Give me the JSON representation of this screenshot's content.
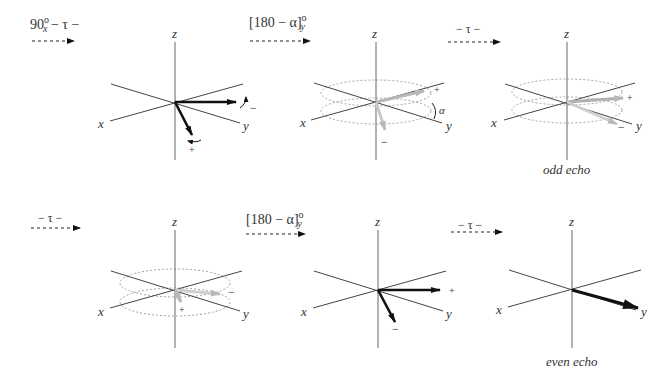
{
  "figure": {
    "pulse_steps": [
      {
        "id": "s1",
        "pre": "90",
        "sup": "o",
        "sub": "x",
        "post": " − τ −"
      },
      {
        "id": "s2",
        "pre": "[180 − α]",
        "sup": "o",
        "sub": "y",
        "post": ""
      },
      {
        "id": "s3",
        "pre": "− τ −",
        "sup": "",
        "sub": "",
        "post": ""
      },
      {
        "id": "s4",
        "pre": "− τ −",
        "sup": "",
        "sub": "",
        "post": ""
      },
      {
        "id": "s5",
        "pre": "[180 − α]",
        "sup": "o",
        "sub": "y",
        "post": ""
      },
      {
        "id": "s6",
        "pre": "− τ −",
        "sup": "",
        "sub": "",
        "post": ""
      }
    ],
    "axis_labels": {
      "x": "x",
      "y": "y",
      "z": "z"
    },
    "sign_plus": "+",
    "sign_minus": "−",
    "angle_label": "α",
    "captions": {
      "odd": "odd echo",
      "even": "even echo"
    },
    "colors": {
      "axis": "#333333",
      "vector": "#111111",
      "faded_vector": "#bdbdbd",
      "dotted": "#888888"
    }
  }
}
